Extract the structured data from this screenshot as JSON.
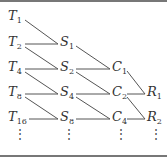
{
  "diagram": {
    "type": "staged-combination-network",
    "columns": [
      {
        "name": "T",
        "nodes": [
          {
            "symbol": "T",
            "sub": "1"
          },
          {
            "symbol": "T",
            "sub": "2"
          },
          {
            "symbol": "T",
            "sub": "4"
          },
          {
            "symbol": "T",
            "sub": "8"
          },
          {
            "symbol": "T",
            "sub": "16"
          }
        ]
      },
      {
        "name": "S",
        "nodes": [
          {
            "symbol": "S",
            "sub": "1"
          },
          {
            "symbol": "S",
            "sub": "2"
          },
          {
            "symbol": "S",
            "sub": "4"
          },
          {
            "symbol": "S",
            "sub": "8"
          }
        ]
      },
      {
        "name": "C",
        "nodes": [
          {
            "symbol": "C",
            "sub": "1"
          },
          {
            "symbol": "C",
            "sub": "2"
          },
          {
            "symbol": "C",
            "sub": "4"
          }
        ]
      },
      {
        "name": "R",
        "nodes": [
          {
            "symbol": "R",
            "sub": "1"
          },
          {
            "symbol": "R",
            "sub": "2"
          }
        ]
      }
    ],
    "continuation": "⋮",
    "edges": [
      [
        "T1",
        "S1"
      ],
      [
        "T2",
        "S1"
      ],
      [
        "T2",
        "S2"
      ],
      [
        "T4",
        "S2"
      ],
      [
        "T4",
        "S4"
      ],
      [
        "T8",
        "S4"
      ],
      [
        "T8",
        "S8"
      ],
      [
        "T16",
        "S8"
      ],
      [
        "S1",
        "C1"
      ],
      [
        "S2",
        "C1"
      ],
      [
        "S2",
        "C2"
      ],
      [
        "S4",
        "C2"
      ],
      [
        "S4",
        "C4"
      ],
      [
        "S8",
        "C4"
      ],
      [
        "C1",
        "R1"
      ],
      [
        "C2",
        "R1"
      ],
      [
        "C2",
        "R2"
      ],
      [
        "C4",
        "R2"
      ]
    ],
    "colors": {
      "line": "#555555",
      "text": "#333333",
      "rule": "#777777"
    }
  }
}
